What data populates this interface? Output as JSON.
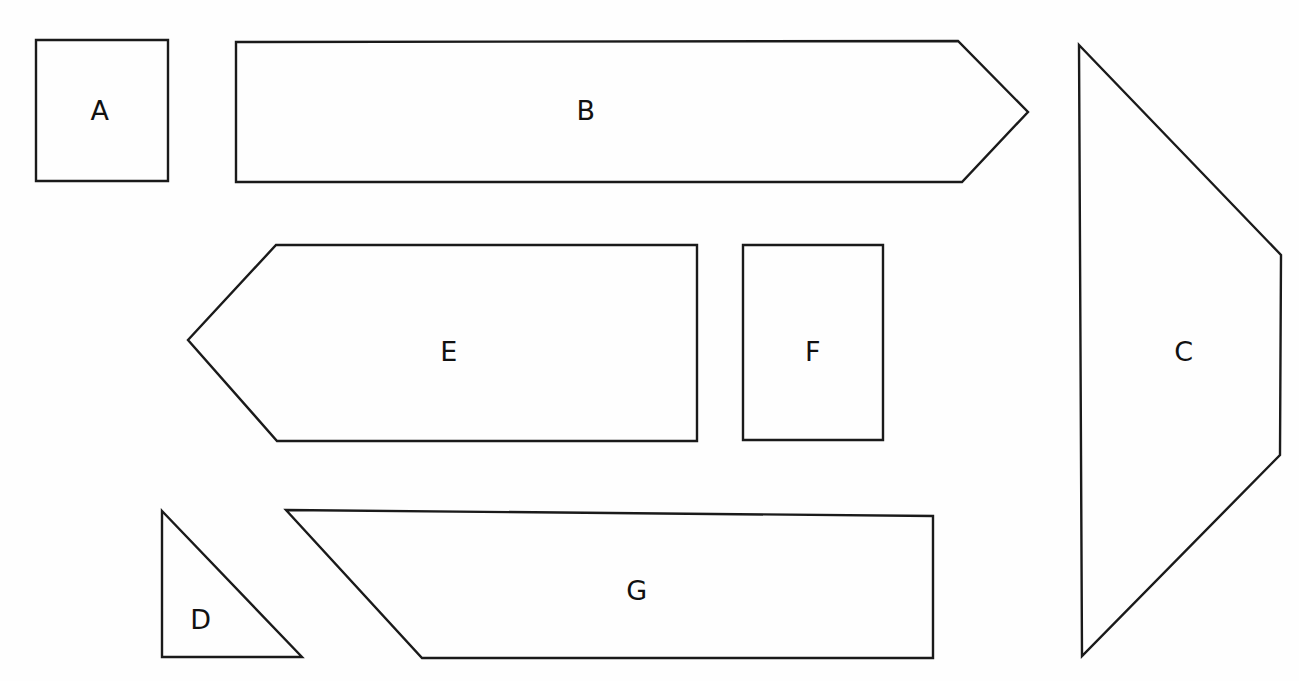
{
  "document": {
    "title": "Shape Nesting Diagram",
    "background_color": "#fefefe",
    "stroke_color": "#1a1a1a",
    "label_color": "#111111",
    "canvas_width": 1299,
    "canvas_height": 681
  },
  "shapes": [
    {
      "id": "shape-a",
      "label": "A",
      "type": "rectangle",
      "points": "36,40 168,40 168,181 36,181",
      "label_x": 100,
      "label_y": 112
    },
    {
      "id": "shape-b",
      "label": "B",
      "type": "hexagon-arrow",
      "points": "236,42 958,41 1028,112 962,182 236,182",
      "label_x": 586,
      "label_y": 112
    },
    {
      "id": "shape-c",
      "label": "C",
      "type": "pentagon",
      "points": "1079,45 1281,255 1280,455 1082,656 1079,45",
      "label_x": 1184,
      "label_y": 353
    },
    {
      "id": "shape-d",
      "label": "D",
      "type": "right-triangle",
      "points": "162,511 302,657 162,657",
      "label_x": 201,
      "label_y": 621
    },
    {
      "id": "shape-e",
      "label": "E",
      "type": "arrow-pentagon",
      "points": "276,245 697,245 697,441 277,441 188,340",
      "label_x": 449,
      "label_y": 353
    },
    {
      "id": "shape-f",
      "label": "F",
      "type": "rectangle",
      "points": "743,245 883,245 883,440 743,440",
      "label_x": 813,
      "label_y": 353
    },
    {
      "id": "shape-g",
      "label": "G",
      "type": "trapezoid",
      "points": "286,510 933,516 933,658 422,658",
      "label_x": 637,
      "label_y": 592
    }
  ]
}
